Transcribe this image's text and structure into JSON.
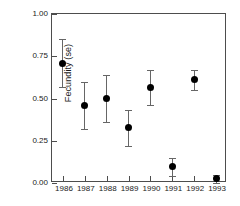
{
  "chart_data": {
    "type": "scatter",
    "title": "",
    "subtitle": "",
    "xlabel": "",
    "ylabel": "Fecundity (se)",
    "categories": [
      "1986",
      "1987",
      "1988",
      "1989",
      "1990",
      "1991",
      "1992",
      "1993"
    ],
    "values": [
      0.71,
      0.46,
      0.5,
      0.33,
      0.565,
      0.095,
      0.61,
      0.025
    ],
    "errors_low": [
      0.57,
      0.32,
      0.36,
      0.22,
      0.46,
      0.04,
      0.55,
      0.0
    ],
    "errors_high": [
      0.85,
      0.6,
      0.64,
      0.43,
      0.67,
      0.15,
      0.67,
      0.05
    ],
    "error_type": "se",
    "ylim": [
      0.0,
      1.0
    ],
    "yticks": [
      "0.00",
      "0.25",
      "0.50",
      "0.75",
      "1.00"
    ],
    "ytick_values": [
      0.0,
      0.25,
      0.5,
      0.75,
      1.0
    ],
    "grid": false,
    "legend": "none",
    "marker": "filled-circle",
    "marker_color": "#000000",
    "errorbar_color": "#666666",
    "axis_color": "#4d4d4d",
    "background_color": "#ffffff",
    "frame": "box"
  }
}
